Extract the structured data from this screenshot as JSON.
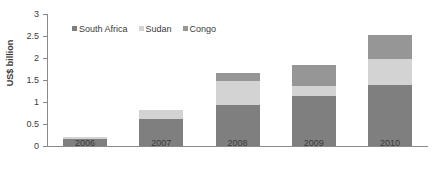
{
  "chart_data": {
    "type": "bar",
    "subtype": "stacked-bar",
    "title": "",
    "subtitle": "",
    "xlabel": "",
    "ylabel": "US$ billion",
    "ylim": [
      0,
      3
    ],
    "ytick_labels": [
      "0",
      "0.5",
      "1",
      "1.5",
      "2",
      "2.5",
      "3"
    ],
    "ytick_values": [
      0,
      0.5,
      1,
      1.5,
      2,
      2.5,
      3
    ],
    "grid": false,
    "legend_position": "top-left-inside",
    "categories": [
      "2006",
      "2007",
      "2008",
      "2009",
      "2010"
    ],
    "series": [
      {
        "name": "South Africa",
        "color": "#7f7f7f",
        "values": [
          0.15,
          0.62,
          0.93,
          1.14,
          1.39
        ]
      },
      {
        "name": "Sudan",
        "color": "#d3d3d3",
        "values": [
          0.05,
          0.21,
          0.55,
          0.23,
          0.58
        ]
      },
      {
        "name": "Congo",
        "color": "#969696",
        "values": [
          0.0,
          0.0,
          0.17,
          0.48,
          0.55
        ]
      }
    ],
    "totals": [
      0.2,
      0.83,
      1.65,
      1.85,
      2.52
    ]
  },
  "axis": {
    "y_title": "US$ billion",
    "y_ticks": [
      "3",
      "2.5",
      "2",
      "1.5",
      "1",
      "0.5",
      "0"
    ],
    "x_ticks": [
      "2006",
      "2007",
      "2008",
      "2009",
      "2010"
    ]
  },
  "legend": {
    "items": [
      {
        "label": "South Africa",
        "color": "#7f7f7f"
      },
      {
        "label": "Sudan",
        "color": "#d3d3d3"
      },
      {
        "label": "Congo",
        "color": "#969696"
      }
    ]
  },
  "colors": {
    "south_africa": "#7f7f7f",
    "sudan": "#d3d3d3",
    "congo": "#969696",
    "axis": "#8a8a8a",
    "text": "#3a3a3a",
    "background": "#ffffff"
  }
}
